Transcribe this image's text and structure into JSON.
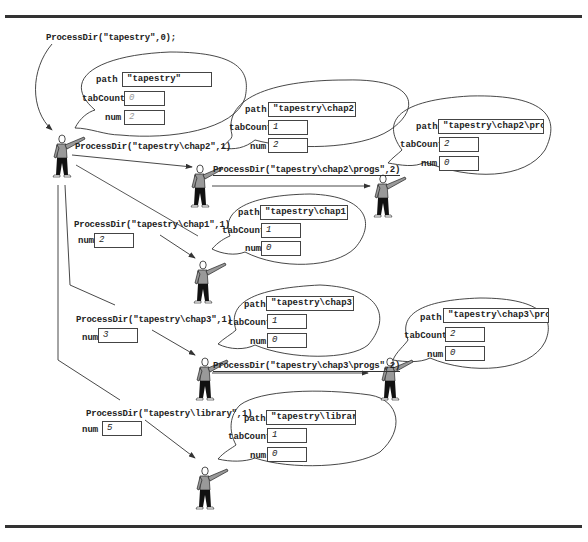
{
  "figure": {
    "initial_call": "ProcessDir(\"tapestry\",0);",
    "frames": [
      {
        "id": "root",
        "path": "\"tapestry\"",
        "tabCount": "0",
        "num": "2",
        "labels": {
          "path": "path",
          "tabCount": "tabCount",
          "num": "num"
        }
      },
      {
        "id": "chap2",
        "call": "ProcessDir(\"tapestry\\chap2\",1)",
        "path": "\"tapestry\\chap2\"",
        "tabCount": "1",
        "num": "2",
        "labels": {
          "path": "path",
          "tabCount": "tabCount",
          "num": "num"
        }
      },
      {
        "id": "chap2-progs",
        "call": "ProcessDir(\"tapestry\\chap2\\progs\",2)",
        "path": "\"tapestry\\chap2\\progs\"",
        "tabCount": "2",
        "num": "0",
        "labels": {
          "path": "path",
          "tabCount": "tabCount",
          "num": "num"
        }
      },
      {
        "id": "chap1",
        "call": "ProcessDir(\"tapestry\\chap1\",1)",
        "caller_num_label": "num",
        "caller_num": "2",
        "path": "\"tapestry\\chap1\"",
        "tabCount": "1",
        "num": "0",
        "labels": {
          "path": "path",
          "tabCount": "tabCount",
          "num": "num"
        }
      },
      {
        "id": "chap3",
        "call": "ProcessDir(\"tapestry\\chap3\",1)",
        "caller_num_label": "num",
        "caller_num": "3",
        "path": "\"tapestry\\chap3\"",
        "tabCount": "1",
        "num": "0",
        "labels": {
          "path": "path",
          "tabCount": "tabCount",
          "num": "num"
        }
      },
      {
        "id": "chap3-progs",
        "call": "ProcessDir(\"tapestry\\chap3\\progs\",2)",
        "path": "\"tapestry\\chap3\\progs\"",
        "tabCount": "2",
        "num": "0",
        "labels": {
          "path": "path",
          "tabCount": "tabCount",
          "num": "num"
        }
      },
      {
        "id": "library",
        "call": "ProcessDir(\"tapestry\\library\",1)",
        "caller_num_label": "num",
        "caller_num": "5",
        "path": "\"tapestry\\library\"",
        "tabCount": "1",
        "num": "0",
        "labels": {
          "path": "path",
          "tabCount": "tabCount",
          "num": "num"
        }
      }
    ]
  }
}
